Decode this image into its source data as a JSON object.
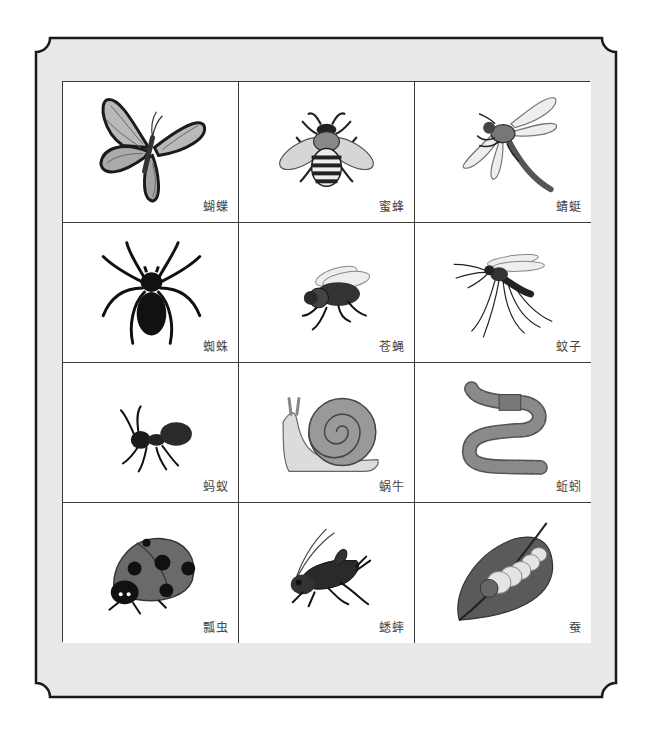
{
  "card": {
    "frame_color": "#1a1a1a",
    "mat_color": "#e9e9e9",
    "grid_line_color": "#3a3a3a"
  },
  "creatures": [
    {
      "id": "butterfly",
      "label": "蝴蝶",
      "icon": "butterfly-icon"
    },
    {
      "id": "bee",
      "label": "蜜蜂",
      "icon": "bee-icon"
    },
    {
      "id": "dragonfly",
      "label": "蜻蜓",
      "icon": "dragonfly-icon"
    },
    {
      "id": "spider",
      "label": "蜘蛛",
      "icon": "spider-icon"
    },
    {
      "id": "fly",
      "label": "苍蝇",
      "icon": "fly-icon"
    },
    {
      "id": "mosquito",
      "label": "蚊子",
      "icon": "mosquito-icon"
    },
    {
      "id": "ant",
      "label": "蚂蚁",
      "icon": "ant-icon"
    },
    {
      "id": "snail",
      "label": "蜗牛",
      "icon": "snail-icon"
    },
    {
      "id": "earthworm",
      "label": "蚯蚓",
      "icon": "earthworm-icon"
    },
    {
      "id": "ladybug",
      "label": "瓢虫",
      "icon": "ladybug-icon"
    },
    {
      "id": "cricket",
      "label": "蟋蟀",
      "icon": "cricket-icon"
    },
    {
      "id": "silkworm",
      "label": "蚕",
      "icon": "silkworm-icon"
    }
  ]
}
